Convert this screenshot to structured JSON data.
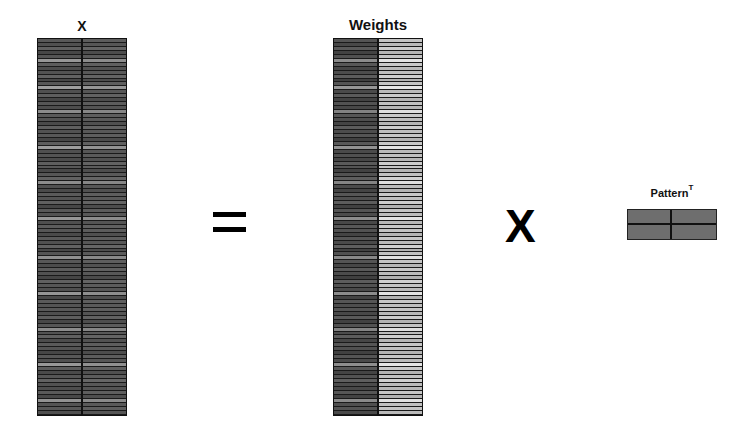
{
  "figure": {
    "equation": "X = Weights x Pattern^T",
    "colors": {
      "background": "#ffffff",
      "lines": "#111111",
      "pattern_fill": "#6e6e6e"
    }
  },
  "matrices": {
    "x": {
      "label": "X",
      "rows": 95,
      "columns": 2,
      "col_shades": [
        [
          88,
          80,
          96,
          70,
          84,
          150,
          92,
          76,
          82,
          98,
          72,
          88,
          160,
          80,
          94,
          70,
          86,
          78,
          140,
          90,
          84,
          74,
          96,
          82,
          88,
          70,
          92,
          156,
          80,
          84,
          76,
          94,
          88,
          72,
          86,
          98,
          140,
          80,
          74,
          90,
          84,
          96,
          70,
          88,
          82,
          150,
          78,
          92,
          86,
          74,
          90,
          80,
          98,
          72,
          84,
          144,
          88,
          76,
          92,
          82,
          70,
          96,
          86,
          80,
          150,
          74,
          90,
          84,
          88,
          78,
          94,
          72,
          86,
          140,
          82,
          96,
          76,
          90,
          84,
          70,
          88,
          80,
          152,
          92,
          74,
          86,
          98,
          82,
          78,
          90,
          72,
          146,
          84,
          88,
          80
        ],
        [
          92,
          86,
          100,
          76,
          90,
          140,
          96,
          82,
          88,
          100,
          78,
          94,
          150,
          86,
          98,
          76,
          92,
          84,
          134,
          94,
          90,
          80,
          100,
          88,
          94,
          76,
          96,
          146,
          86,
          90,
          82,
          98,
          92,
          78,
          90,
          102,
          134,
          86,
          80,
          94,
          90,
          100,
          76,
          92,
          88,
          140,
          84,
          96,
          92,
          80,
          94,
          86,
          102,
          78,
          90,
          136,
          94,
          82,
          96,
          88,
          76,
          100,
          92,
          86,
          142,
          80,
          94,
          90,
          94,
          84,
          98,
          78,
          92,
          134,
          88,
          100,
          82,
          94,
          90,
          76,
          92,
          86,
          144,
          96,
          80,
          92,
          102,
          88,
          84,
          94,
          78,
          138,
          90,
          94,
          86
        ]
      ]
    },
    "weights": {
      "label": "Weights",
      "rows": 95,
      "columns": 2,
      "col_shades": [
        [
          84,
          72,
          90,
          66,
          80,
          140,
          88,
          70,
          76,
          92,
          64,
          84,
          150,
          74,
          90,
          66,
          82,
          72,
          130,
          86,
          78,
          68,
          92,
          76,
          84,
          64,
          88,
          146,
          74,
          80,
          70,
          90,
          84,
          66,
          82,
          94,
          132,
          74,
          68,
          86,
          80,
          92,
          64,
          84,
          76,
          140,
          72,
          88,
          82,
          68,
          86,
          74,
          94,
          66,
          80,
          136,
          84,
          70,
          88,
          76,
          64,
          92,
          82,
          74,
          140,
          68,
          86,
          78,
          84,
          72,
          90,
          66,
          82,
          132,
          76,
          92,
          70,
          86,
          80,
          64,
          84,
          74,
          142,
          88,
          68,
          82,
          94,
          76,
          72,
          86,
          66,
          138,
          80,
          84,
          74
        ],
        [
          196,
          186,
          204,
          180,
          194,
          226,
          200,
          184,
          190,
          206,
          178,
          196,
          230,
          186,
          202,
          180,
          194,
          184,
          222,
          200,
          190,
          182,
          206,
          188,
          196,
          178,
          200,
          228,
          186,
          192,
          182,
          204,
          196,
          180,
          192,
          208,
          222,
          186,
          180,
          200,
          192,
          206,
          178,
          196,
          188,
          226,
          184,
          200,
          194,
          180,
          198,
          186,
          208,
          178,
          192,
          224,
          196,
          182,
          200,
          188,
          178,
          206,
          194,
          186,
          228,
          180,
          198,
          190,
          196,
          184,
          204,
          178,
          194,
          222,
          188,
          206,
          182,
          198,
          192,
          178,
          196,
          186,
          228,
          200,
          180,
          194,
          208,
          188,
          184,
          198,
          178,
          224,
          192,
          196,
          186
        ]
      ]
    },
    "pattern_t": {
      "label": "Pattern",
      "superscript": "T",
      "rows": 2,
      "columns": 2
    }
  },
  "operators": {
    "equals": "=",
    "multiply": "X"
  }
}
